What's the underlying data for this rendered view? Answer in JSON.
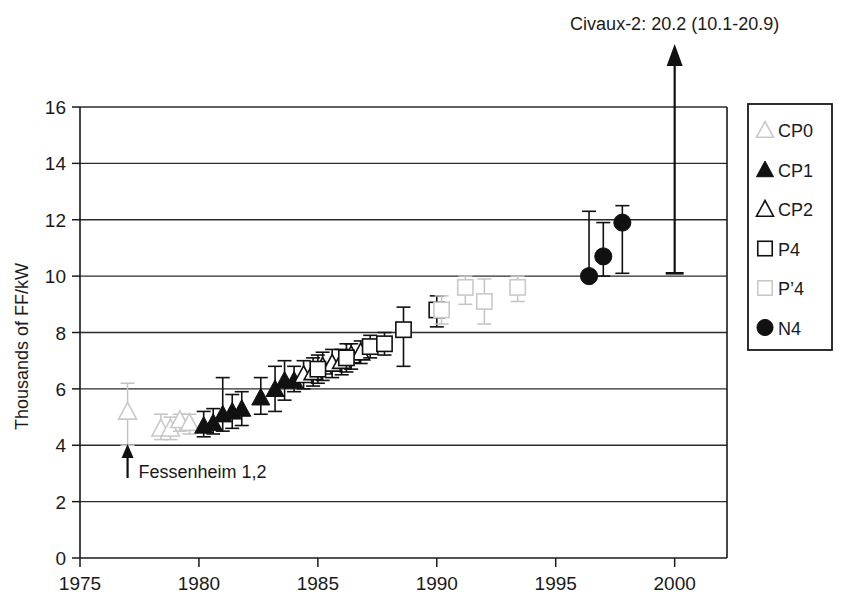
{
  "chart_data": {
    "type": "scatter",
    "title": "",
    "xlabel": "",
    "ylabel": "Thousands of FF/kW",
    "xlim": [
      1975,
      2002
    ],
    "ylim": [
      0,
      16
    ],
    "grid": true,
    "legend_position": "right",
    "xticks": [
      "1975",
      "1980",
      "1985",
      "1990",
      "1995",
      "2000"
    ],
    "yticks": [
      "0",
      "2",
      "4",
      "6",
      "8",
      "10",
      "12",
      "14",
      "16"
    ],
    "error_bars": "vertical ranges with caps",
    "annotations": [
      {
        "name": "civaux-2-annotation",
        "text": "Civaux-2: 20.2 (10.1-20.9)",
        "x": 2000.0,
        "value": 20.2,
        "low": 10.1,
        "high": 20.9
      },
      {
        "name": "fessenheim-annotation",
        "text": "Fessenheim 1,2",
        "x": 1977.0,
        "value": 5.2
      }
    ],
    "series": [
      {
        "name": "CP0",
        "marker": "triangle-open-light",
        "color": "#cfcfcf",
        "points": [
          {
            "x": 1977.0,
            "y": 5.2,
            "low": 4.0,
            "high": 6.2
          },
          {
            "x": 1978.4,
            "y": 4.6,
            "low": 4.2,
            "high": 5.1
          },
          {
            "x": 1978.8,
            "y": 4.6,
            "low": 4.2,
            "high": 5.0
          },
          {
            "x": 1979.2,
            "y": 4.9,
            "low": 4.5,
            "high": 5.1
          },
          {
            "x": 1979.6,
            "y": 4.8,
            "low": 4.4,
            "high": 5.1
          }
        ]
      },
      {
        "name": "CP1",
        "marker": "triangle-filled",
        "color": "#111111",
        "points": [
          {
            "x": 1980.2,
            "y": 4.7,
            "low": 4.3,
            "high": 5.2
          },
          {
            "x": 1980.6,
            "y": 4.8,
            "low": 4.4,
            "high": 5.3
          },
          {
            "x": 1981.0,
            "y": 5.1,
            "low": 4.5,
            "high": 6.4
          },
          {
            "x": 1981.4,
            "y": 5.2,
            "low": 4.6,
            "high": 5.8
          },
          {
            "x": 1981.8,
            "y": 5.3,
            "low": 4.7,
            "high": 5.9
          },
          {
            "x": 1982.6,
            "y": 5.7,
            "low": 5.1,
            "high": 6.4
          },
          {
            "x": 1983.2,
            "y": 6.0,
            "low": 5.2,
            "high": 6.8
          },
          {
            "x": 1983.6,
            "y": 6.3,
            "low": 5.6,
            "high": 7.0
          },
          {
            "x": 1984.0,
            "y": 6.3,
            "low": 5.9,
            "high": 6.8
          }
        ]
      },
      {
        "name": "CP2",
        "marker": "triangle-open",
        "color": "#111111",
        "points": [
          {
            "x": 1984.4,
            "y": 6.5,
            "low": 6.0,
            "high": 7.0
          },
          {
            "x": 1984.8,
            "y": 6.6,
            "low": 6.1,
            "high": 7.1
          },
          {
            "x": 1985.2,
            "y": 6.8,
            "low": 6.3,
            "high": 7.3
          },
          {
            "x": 1985.6,
            "y": 6.9,
            "low": 6.4,
            "high": 7.4
          },
          {
            "x": 1986.0,
            "y": 7.0,
            "low": 6.5,
            "high": 7.4
          },
          {
            "x": 1986.4,
            "y": 7.2,
            "low": 6.7,
            "high": 7.6
          },
          {
            "x": 1986.8,
            "y": 7.3,
            "low": 6.9,
            "high": 7.7
          }
        ]
      },
      {
        "name": "P4",
        "marker": "square-open",
        "color": "#111111",
        "points": [
          {
            "x": 1985.0,
            "y": 6.7,
            "low": 6.2,
            "high": 7.2
          },
          {
            "x": 1986.2,
            "y": 7.1,
            "low": 6.6,
            "high": 7.6
          },
          {
            "x": 1987.2,
            "y": 7.5,
            "low": 7.1,
            "high": 7.9
          },
          {
            "x": 1987.8,
            "y": 7.6,
            "low": 7.2,
            "high": 8.0
          },
          {
            "x": 1988.6,
            "y": 8.1,
            "low": 6.8,
            "high": 8.9
          },
          {
            "x": 1990.0,
            "y": 8.8,
            "low": 8.2,
            "high": 9.3
          }
        ]
      },
      {
        "name": "P'4",
        "marker": "square-open-light",
        "color": "#c9c9c9",
        "points": [
          {
            "x": 1990.2,
            "y": 8.8,
            "low": 8.3,
            "high": 9.3
          },
          {
            "x": 1991.2,
            "y": 9.6,
            "low": 9.0,
            "high": 10.0
          },
          {
            "x": 1992.0,
            "y": 9.1,
            "low": 8.3,
            "high": 9.9
          },
          {
            "x": 1993.4,
            "y": 9.6,
            "low": 9.1,
            "high": 10.0
          }
        ]
      },
      {
        "name": "N4",
        "marker": "circle-filled",
        "color": "#111111",
        "points": [
          {
            "x": 1996.4,
            "y": 10.0,
            "low": 9.9,
            "high": 12.3
          },
          {
            "x": 1997.0,
            "y": 10.7,
            "low": 10.0,
            "high": 11.9
          },
          {
            "x": 1997.8,
            "y": 11.9,
            "low": 10.1,
            "high": 12.5
          }
        ]
      }
    ]
  },
  "legend": {
    "items": [
      {
        "label": "CP0",
        "marker": "triangle-open-light"
      },
      {
        "label": "CP1",
        "marker": "triangle-filled"
      },
      {
        "label": "CP2",
        "marker": "triangle-open"
      },
      {
        "label": "P4",
        "marker": "square-open"
      },
      {
        "label": "P’4",
        "marker": "square-open-light"
      },
      {
        "label": "N4",
        "marker": "circle-filled"
      }
    ]
  }
}
